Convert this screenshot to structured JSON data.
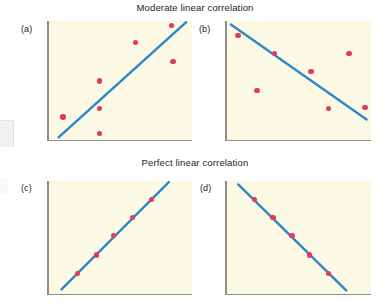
{
  "figure": {
    "title_top": "Moderate linear correlation",
    "title_bottom": "Perfect linear correlation",
    "labels": {
      "a": "(a)",
      "b": "(b)",
      "c": "(c)",
      "d": "(d)"
    },
    "colors": {
      "plot_background": "#fbf8e3",
      "axis": "#8f8f8a",
      "trend_line": "#2e87c6",
      "data_point": "#e23a5e",
      "page_background": "#ffffff",
      "text": "#1c1c1c"
    }
  },
  "chart_data": [
    {
      "id": "a",
      "type": "scatter",
      "title": "Moderate linear correlation",
      "panel_label": "(a)",
      "description": "Moderate positive linear correlation with fitted trend line",
      "xlabel": "",
      "ylabel": "",
      "xlim": [
        0,
        100
      ],
      "ylim": [
        0,
        100
      ],
      "grid": false,
      "axes_shown": [
        "left",
        "bottom"
      ],
      "points": [
        {
          "x": 11,
          "y": 20
        },
        {
          "x": 36,
          "y": 6
        },
        {
          "x": 36,
          "y": 27
        },
        {
          "x": 36,
          "y": 50
        },
        {
          "x": 61,
          "y": 82
        },
        {
          "x": 86,
          "y": 96
        },
        {
          "x": 87,
          "y": 66
        }
      ],
      "trend_line": {
        "x1": 8,
        "y1": 3,
        "x2": 96,
        "y2": 99,
        "slope_sign": "positive"
      }
    },
    {
      "id": "b",
      "type": "scatter",
      "title": "Moderate linear correlation",
      "panel_label": "(b)",
      "description": "Moderate negative linear correlation with fitted trend line",
      "xlabel": "",
      "ylabel": "",
      "xlim": [
        0,
        100
      ],
      "ylim": [
        0,
        100
      ],
      "grid": false,
      "axes_shown": [
        "left",
        "bottom"
      ],
      "points": [
        {
          "x": 9,
          "y": 88
        },
        {
          "x": 34,
          "y": 73
        },
        {
          "x": 59,
          "y": 58
        },
        {
          "x": 22,
          "y": 42
        },
        {
          "x": 85,
          "y": 73
        },
        {
          "x": 71,
          "y": 27
        },
        {
          "x": 96,
          "y": 28
        }
      ],
      "trend_line": {
        "x1": 4,
        "y1": 97,
        "x2": 97,
        "y2": 18,
        "slope_sign": "negative"
      }
    },
    {
      "id": "c",
      "type": "scatter",
      "title": "Perfect linear correlation",
      "panel_label": "(c)",
      "description": "Perfect positive linear correlation; all points lie exactly on the line",
      "xlabel": "",
      "ylabel": "",
      "xlim": [
        0,
        100
      ],
      "ylim": [
        0,
        100
      ],
      "grid": false,
      "axes_shown": [
        "left",
        "bottom"
      ],
      "points": [
        {
          "x": 21,
          "y": 19
        },
        {
          "x": 34,
          "y": 35
        },
        {
          "x": 46,
          "y": 52
        },
        {
          "x": 59,
          "y": 68
        },
        {
          "x": 72,
          "y": 84
        }
      ],
      "trend_line": {
        "x1": 10,
        "y1": 5,
        "x2": 84,
        "y2": 99,
        "slope_sign": "positive"
      }
    },
    {
      "id": "d",
      "type": "scatter",
      "title": "Perfect linear correlation",
      "panel_label": "(d)",
      "description": "Perfect negative linear correlation; all points lie exactly on the line",
      "xlabel": "",
      "ylabel": "",
      "xlim": [
        0,
        100
      ],
      "ylim": [
        0,
        100
      ],
      "grid": false,
      "axes_shown": [
        "left",
        "bottom"
      ],
      "points": [
        {
          "x": 20,
          "y": 84
        },
        {
          "x": 33,
          "y": 68
        },
        {
          "x": 46,
          "y": 52
        },
        {
          "x": 58,
          "y": 35
        },
        {
          "x": 71,
          "y": 19
        }
      ],
      "trend_line": {
        "x1": 9,
        "y1": 97,
        "x2": 83,
        "y2": 4,
        "slope_sign": "negative"
      }
    }
  ]
}
